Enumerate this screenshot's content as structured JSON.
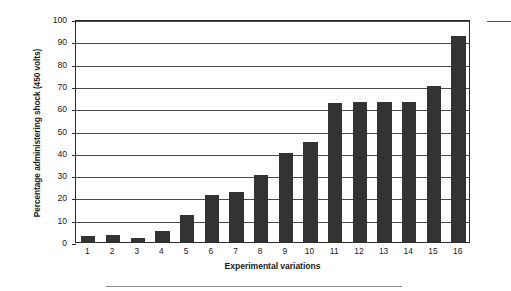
{
  "chart_data": {
    "type": "bar",
    "title": "",
    "xlabel": "Experimental variations",
    "ylabel": "Percentage administering shock (450 volts)",
    "categories": [
      "1",
      "2",
      "3",
      "4",
      "5",
      "6",
      "7",
      "8",
      "9",
      "10",
      "11",
      "12",
      "13",
      "14",
      "15",
      "16"
    ],
    "values": [
      2.5,
      3,
      2,
      5,
      12,
      21,
      22.5,
      30,
      40,
      45,
      62.5,
      63,
      63,
      63,
      70,
      92.5
    ],
    "ylim": [
      0,
      100
    ],
    "yticks": [
      0,
      10,
      20,
      30,
      40,
      50,
      60,
      70,
      80,
      90,
      100
    ],
    "ytick_labels": [
      "0",
      "10",
      "20",
      "30",
      "40",
      "50",
      "60",
      "70",
      "80",
      "90",
      "100"
    ],
    "grid": true,
    "legend": "none",
    "bar_color": "#333333",
    "gridline_color": "#4a4a4a",
    "axis_color": "#2b2b2b",
    "background_color": "#ffffff",
    "series": [
      {
        "name": "Percentage administering shock (450 volts)",
        "values": [
          2.5,
          3,
          2,
          5,
          12,
          21,
          22.5,
          30,
          40,
          45,
          62.5,
          63,
          63,
          63,
          70,
          92.5
        ]
      }
    ]
  },
  "decoration": {
    "bottom_rule_color": "#8d8d8d",
    "corner_rule_color": "#555555"
  }
}
